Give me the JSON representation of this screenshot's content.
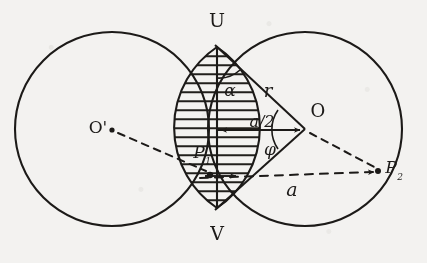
{
  "figure": {
    "kind": "geometry-diagram",
    "background_color": "#f3f2f0",
    "ink_color": "#1c1a18",
    "labels": {
      "u": "U",
      "v": "V",
      "o": "O",
      "o_prime": "O'",
      "alpha": "α",
      "r": "r",
      "a_half": "a/2",
      "phi": "φ",
      "a": "a",
      "p1_base": "P",
      "p1_sub": "1",
      "p2_base": "P",
      "p2_sub": "2"
    },
    "geometry": {
      "circle_left": {
        "cx": 112,
        "cy": 129,
        "r": 97
      },
      "circle_right": {
        "cx": 305,
        "cy": 129,
        "r": 97
      },
      "point_u": {
        "x": 217,
        "y": 47
      },
      "point_v": {
        "x": 217,
        "y": 208
      },
      "point_o": {
        "x": 305,
        "y": 129
      },
      "point_o_prime": {
        "x": 112,
        "y": 129
      },
      "point_p1": {
        "x": 210,
        "y": 176
      },
      "point_p2": {
        "x": 380,
        "y": 172
      },
      "hatch_orientation": "horizontal",
      "hatch_spacing_px": 9
    }
  }
}
